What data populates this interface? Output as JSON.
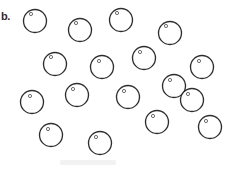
{
  "figure": {
    "label": "b.",
    "width": 231,
    "height": 169,
    "background_color": "#ffffff",
    "object_name": "circle-with-highlight",
    "object_count": 17,
    "stroke_color": "#2e2e30",
    "highlight_stroke_color": "#54545a",
    "label_color": "#2b2b2b"
  },
  "chart_data": {
    "type": "scatter",
    "title": "b.",
    "xlabel": "",
    "ylabel": "",
    "xlim": [
      0,
      231
    ],
    "ylim": [
      0,
      169
    ],
    "grid": false,
    "legend": "none",
    "marker": "circle-outline-with-small-highlight-dot",
    "count": 17,
    "series": [
      {
        "name": "circles",
        "points": [
          {
            "id": 1,
            "cx": 35,
            "cy": 21,
            "r": 11.5,
            "hx": 31,
            "hy": 14,
            "hr": 1.6
          },
          {
            "id": 2,
            "cx": 80,
            "cy": 30,
            "r": 11.5,
            "hx": 76,
            "hy": 23,
            "hr": 1.6
          },
          {
            "id": 3,
            "cx": 121,
            "cy": 20,
            "r": 11.5,
            "hx": 117,
            "hy": 13,
            "hr": 1.6
          },
          {
            "id": 4,
            "cx": 170,
            "cy": 33,
            "r": 11.5,
            "hx": 166,
            "hy": 26,
            "hr": 1.6
          },
          {
            "id": 5,
            "cx": 55,
            "cy": 64,
            "r": 11.5,
            "hx": 51,
            "hy": 57,
            "hr": 1.6
          },
          {
            "id": 6,
            "cx": 102,
            "cy": 67,
            "r": 11.5,
            "hx": 99,
            "hy": 61,
            "hr": 1.6
          },
          {
            "id": 7,
            "cx": 144,
            "cy": 58,
            "r": 11.5,
            "hx": 140,
            "hy": 52,
            "hr": 1.6
          },
          {
            "id": 8,
            "cx": 202,
            "cy": 67,
            "r": 11.5,
            "hx": 199,
            "hy": 61,
            "hr": 1.6
          },
          {
            "id": 9,
            "cx": 174,
            "cy": 86,
            "r": 11.5,
            "hx": 170,
            "hy": 80,
            "hr": 1.6
          },
          {
            "id": 10,
            "cx": 77,
            "cy": 95,
            "r": 11.5,
            "hx": 73,
            "hy": 89,
            "hr": 1.6
          },
          {
            "id": 11,
            "cx": 128,
            "cy": 97,
            "r": 11.5,
            "hx": 124,
            "hy": 91,
            "hr": 1.6
          },
          {
            "id": 12,
            "cx": 32,
            "cy": 102,
            "r": 11.5,
            "hx": 30,
            "hy": 96,
            "hr": 1.6
          },
          {
            "id": 13,
            "cx": 157,
            "cy": 122,
            "r": 11.5,
            "hx": 153,
            "hy": 116,
            "hr": 1.6
          },
          {
            "id": 14,
            "cx": 210,
            "cy": 127,
            "r": 11.5,
            "hx": 206,
            "hy": 121,
            "hr": 1.6
          },
          {
            "id": 15,
            "cx": 51,
            "cy": 135,
            "r": 11.5,
            "hx": 48,
            "hy": 129,
            "hr": 1.6
          },
          {
            "id": 16,
            "cx": 100,
            "cy": 143,
            "r": 11.5,
            "hx": 96,
            "hy": 137,
            "hr": 1.6
          },
          {
            "id": 17,
            "cx": 192,
            "cy": 100,
            "r": 11.5,
            "hx": 188,
            "hy": 94,
            "hr": 1.6
          }
        ]
      }
    ]
  }
}
